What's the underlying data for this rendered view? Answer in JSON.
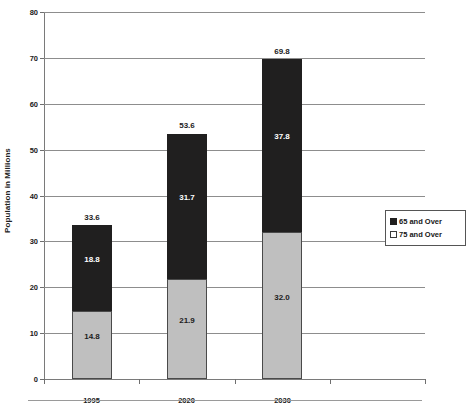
{
  "chart_data": {
    "type": "bar",
    "subtype": "stacked-bar",
    "title": "",
    "xlabel": "",
    "ylabel": "Population in Millions",
    "categories": [
      "1995",
      "2020",
      "2030"
    ],
    "trailing_empty_category": true,
    "ylim": [
      0,
      80
    ],
    "ytick_step": 10,
    "yticks": [
      0,
      10,
      20,
      30,
      40,
      50,
      60,
      70,
      80
    ],
    "ytick_labels": [
      "0",
      "10",
      "20",
      "30",
      "40",
      "50",
      "60",
      "70",
      "80"
    ],
    "grid": true,
    "grid_axis": "y",
    "legend_position": "inside-right",
    "series": [
      {
        "name": "75 and Over",
        "color": "#bfbfbf",
        "stack_order": 0,
        "values": [
          14.8,
          21.9,
          32.0
        ],
        "value_labels": [
          "14.8",
          "21.9",
          "32.0"
        ]
      },
      {
        "name": "65 and Over",
        "color": "#201f1f",
        "stack_order": 1,
        "values": [
          18.8,
          31.7,
          37.8
        ],
        "value_labels": [
          "18.8",
          "31.7",
          "37.8"
        ]
      }
    ],
    "totals": [
      33.6,
      53.6,
      69.8
    ],
    "total_labels": [
      "33.6",
      "53.6",
      "69.8"
    ]
  },
  "axes": {
    "y_title": "Population in Millions",
    "y_ticks": [
      {
        "value": 80,
        "label": "80"
      },
      {
        "value": 70,
        "label": "70"
      },
      {
        "value": 60,
        "label": "60"
      },
      {
        "value": 50,
        "label": "50"
      },
      {
        "value": 40,
        "label": "40"
      },
      {
        "value": 30,
        "label": "30"
      },
      {
        "value": 20,
        "label": "20"
      },
      {
        "value": 10,
        "label": "10"
      },
      {
        "value": 0,
        "label": "0"
      }
    ],
    "x_labels": [
      "1995",
      "2020",
      "2030"
    ]
  },
  "bars": [
    {
      "category": "1995",
      "total_label": "33.6",
      "lower_label": "14.8",
      "upper_label": "18.8"
    },
    {
      "category": "2020",
      "total_label": "53.6",
      "lower_label": "21.9",
      "upper_label": "31.7"
    },
    {
      "category": "2030",
      "total_label": "69.8",
      "lower_label": "32.0",
      "upper_label": "37.8"
    }
  ],
  "legend": {
    "entries": [
      {
        "label": "65 and Over",
        "swatch": "black"
      },
      {
        "label": "75 and Over",
        "swatch": "white"
      }
    ]
  },
  "colors": {
    "series_65_and_over": "#201f1f",
    "series_75_and_over": "#bfbfbf",
    "gridline": "#8d8d8d",
    "axis": "#7a7a7a",
    "text": "#1a1a1a"
  }
}
